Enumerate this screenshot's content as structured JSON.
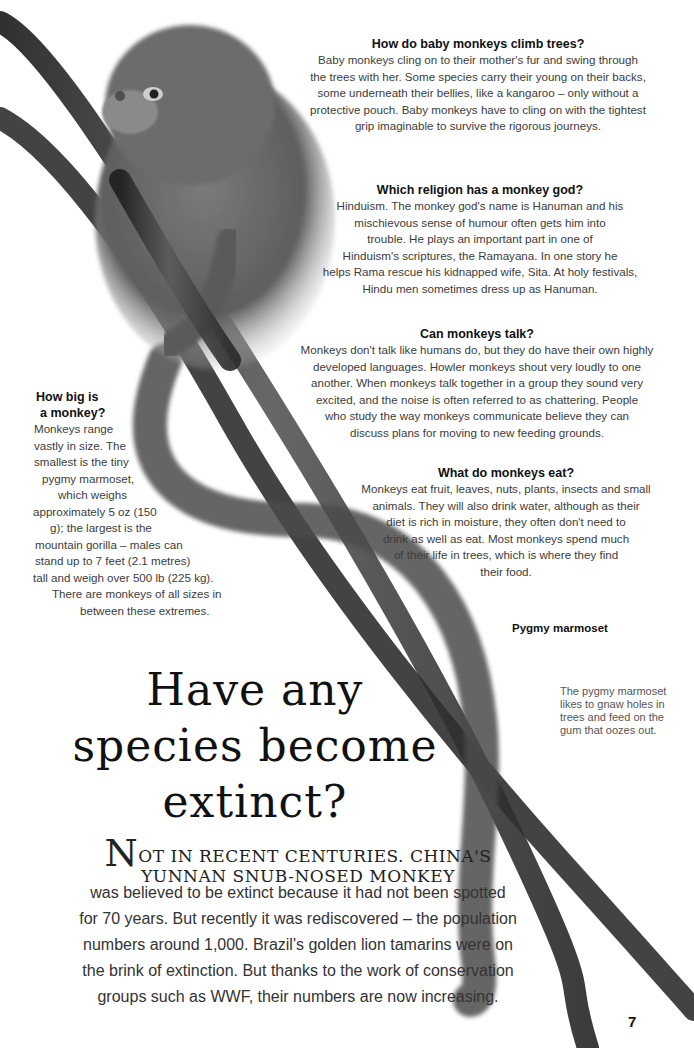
{
  "sidebar_qa": [
    {
      "question": "How do baby monkeys climb trees?",
      "answer_lines": [
        "Baby monkeys cling on to their mother's fur and swing through",
        "the trees with her. Some species carry their young on their backs,",
        "some underneath their bellies, like a kangaroo – only without a",
        "protective pouch. Baby monkeys have to cling on with the tightest",
        "grip imaginable to survive the rigorous journeys."
      ]
    },
    {
      "question": "Which religion has a monkey god?",
      "answer_lines": [
        "Hinduism. The monkey god's name is Hanuman and his",
        "mischievous sense of humour often gets him into",
        "trouble. He plays an important part in one of",
        "Hinduism's scriptures, the Ramayana. In one story he",
        "helps Rama rescue his kidnapped wife, Sita. At holy festivals,",
        "Hindu men sometimes dress up as Hanuman."
      ]
    },
    {
      "question": "Can monkeys talk?",
      "answer_lines": [
        "Monkeys don't talk like humans do, but they do have their own highly",
        "developed languages. Howler monkeys shout very loudly to one",
        "another. When monkeys talk together in a group they sound very",
        "excited, and the noise is often referred to as chattering. People",
        "who study the way monkeys communicate believe they can",
        "discuss plans for moving to new feeding grounds."
      ]
    },
    {
      "question_lines": [
        "How big is",
        "a monkey?"
      ],
      "answer_lines": [
        "Monkeys range",
        "vastly in size. The",
        "smallest is the tiny",
        "pygmy marmoset,",
        "which weighs",
        "approximately 5 oz (150",
        "g); the largest is the",
        "mountain gorilla – males can",
        "stand up to 7 feet (2.1 metres)",
        "tall and weigh over 500 lb (225 kg).",
        "There are monkeys of all sizes in",
        "between these extremes."
      ]
    },
    {
      "question": "What do monkeys eat?",
      "answer_lines": [
        "Monkeys eat fruit, leaves, nuts, plants, insects and small",
        "animals. They will also drink water, although as their",
        "diet is rich in moisture, they often don't need to",
        "drink as well as eat. Most monkeys spend much",
        "of their life in trees, which is where they find",
        "their food."
      ]
    }
  ],
  "caption": {
    "title": "Pygmy marmoset",
    "body_lines": [
      "The pygmy marmoset",
      "likes to gnaw holes in",
      "trees and feed on the",
      "gum that oozes out."
    ]
  },
  "feature": {
    "headline_lines": [
      "Have any",
      "species become",
      "extinct?"
    ],
    "lede_drop_cap": "N",
    "lede_line1": "OT IN RECENT CENTURIES. CHINA'S",
    "lede_line2": "YUNNAN SNUB-NOSED MONKEY",
    "body_lines": [
      "was believed to be extinct because it had not been spotted",
      "for 70 years. But recently it was rediscovered – the population",
      "numbers around 1,000. Brazil's golden lion tamarins were on",
      "the brink of extinction. But thanks to the work of conservation",
      "groups such as WWF, their numbers are now increasing."
    ]
  },
  "page_number": "7",
  "illustration": {
    "subject": "pygmy marmoset on branches",
    "colors": {
      "branch": "#3a3a3a",
      "fur": "#6b6b6b",
      "fur_light": "#a8a8a8",
      "tail": "#4a4a4a"
    }
  }
}
